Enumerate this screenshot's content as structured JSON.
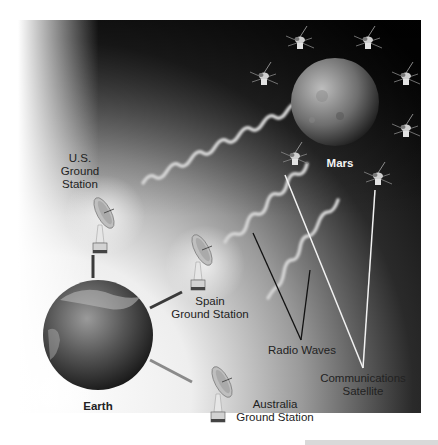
{
  "diagram": {
    "labels": {
      "us_station": [
        "U.S.",
        "Ground",
        "Station"
      ],
      "spain_station": [
        "Spain",
        "Ground Station"
      ],
      "australia_station": [
        "Australia",
        "Ground Station"
      ],
      "earth": "Earth",
      "mars": "Mars",
      "radio_waves": "Radio Waves",
      "comm_satellite": [
        "Communications",
        "Satellite"
      ]
    },
    "nodes": [
      {
        "id": "earth",
        "type": "planet",
        "label": "Earth"
      },
      {
        "id": "mars",
        "type": "planet",
        "label": "Mars"
      },
      {
        "id": "us",
        "type": "ground-station",
        "label": "U.S. Ground Station"
      },
      {
        "id": "spain",
        "type": "ground-station",
        "label": "Spain Ground Station"
      },
      {
        "id": "australia",
        "type": "ground-station",
        "label": "Australia Ground Station"
      },
      {
        "id": "sat",
        "type": "satellite",
        "label": "Communications Satellite",
        "count": 8
      }
    ],
    "edges": [
      {
        "from": "earth",
        "to": "us",
        "kind": "link"
      },
      {
        "from": "earth",
        "to": "spain",
        "kind": "link"
      },
      {
        "from": "earth",
        "to": "australia",
        "kind": "link"
      },
      {
        "from": "us",
        "to": "sat",
        "kind": "radio-wave"
      },
      {
        "from": "spain",
        "to": "sat",
        "kind": "radio-wave"
      },
      {
        "from": "spain",
        "to": "sat",
        "kind": "radio-wave"
      }
    ],
    "colors": {
      "space_dark": "#050505",
      "space_light": "#f2f2f2",
      "wave": "#d6d6d6",
      "pointer_dark": "#111111",
      "pointer_light": "#f5f5f5",
      "link": "#4a4a4a"
    }
  }
}
